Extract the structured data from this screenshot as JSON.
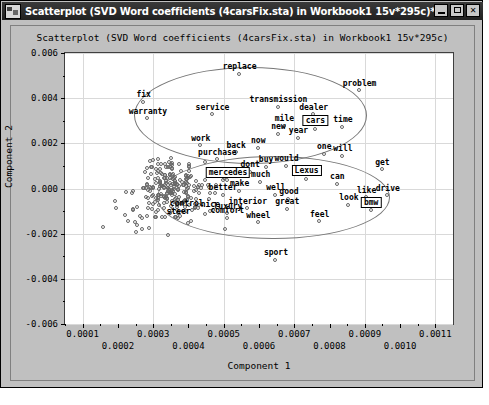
{
  "window": {
    "title": "Scatterplot (SVD Word coefficients (4carsFix.sta) in Workbook1 15v*295c)*",
    "icon": "app-icon",
    "minimize_label": "_",
    "maximize_label": "□",
    "close_label": "✕"
  },
  "chart_data": {
    "type": "scatter",
    "title": "Scatterplot (SVD Word coefficients (4carsFix.sta) in Workbook1 15v*295c)",
    "xlabel": "Component 1",
    "ylabel": "Component 2",
    "xlim": [
      5e-05,
      0.00115
    ],
    "ylim": [
      -0.006,
      0.006
    ],
    "grid": true,
    "legend": "none",
    "xticks": [
      "0.0001",
      "0.0002",
      "0.0003",
      "0.0004",
      "0.0005",
      "0.0006",
      "0.0007",
      "0.0008",
      "0.0009",
      "0.0010",
      "0.0011"
    ],
    "yticks": [
      "0.006",
      "0.004",
      "0.002",
      "0.000",
      "-0.002",
      "-0.004",
      "-0.006"
    ],
    "marker": "open-circle",
    "annotations": [
      {
        "label": "replace",
        "x": 0.000545,
        "y": 0.00507
      },
      {
        "label": "problem",
        "x": 0.000885,
        "y": 0.00432
      },
      {
        "label": "fix",
        "x": 0.000273,
        "y": 0.00382
      },
      {
        "label": "transmission",
        "x": 0.000655,
        "y": 0.0036
      },
      {
        "label": "service",
        "x": 0.000468,
        "y": 0.00327
      },
      {
        "label": "dealer",
        "x": 0.000755,
        "y": 0.00327
      },
      {
        "label": "warranty",
        "x": 0.000285,
        "y": 0.00308
      },
      {
        "label": "mile",
        "x": 0.000672,
        "y": 0.00275
      },
      {
        "label": "time",
        "x": 0.000838,
        "y": 0.00272
      },
      {
        "label": "cars",
        "x": 0.00076,
        "y": 0.00262,
        "boxed": true
      },
      {
        "label": "new",
        "x": 0.000655,
        "y": 0.0024
      },
      {
        "label": "year",
        "x": 0.000712,
        "y": 0.00222
      },
      {
        "label": "work",
        "x": 0.000435,
        "y": 0.0019
      },
      {
        "label": "now",
        "x": 0.000598,
        "y": 0.00178
      },
      {
        "label": "back",
        "x": 0.000535,
        "y": 0.00158
      },
      {
        "label": "one",
        "x": 0.000785,
        "y": 0.00152
      },
      {
        "label": "will",
        "x": 0.000838,
        "y": 0.00142
      },
      {
        "label": "purchase",
        "x": 0.000482,
        "y": 0.00128
      },
      {
        "label": "buy",
        "x": 0.00062,
        "y": 0.00095
      },
      {
        "label": "would",
        "x": 0.000678,
        "y": 0.00098
      },
      {
        "label": "dont",
        "x": 0.000575,
        "y": 0.00072
      },
      {
        "label": "get",
        "x": 0.00095,
        "y": 0.00082
      },
      {
        "label": "Lexus",
        "x": 0.000735,
        "y": 0.00042,
        "boxed": true
      },
      {
        "label": "mercedes",
        "x": 0.000512,
        "y": 0.00035,
        "boxed": true
      },
      {
        "label": "much",
        "x": 0.000605,
        "y": 0.00028
      },
      {
        "label": "can",
        "x": 0.000822,
        "y": 0.00018
      },
      {
        "label": "make",
        "x": 0.000545,
        "y": -0.00012
      },
      {
        "label": "better",
        "x": 0.000498,
        "y": -0.0003
      },
      {
        "label": "well",
        "x": 0.000648,
        "y": -0.0003
      },
      {
        "label": "good",
        "x": 0.000685,
        "y": -0.00048
      },
      {
        "label": "like",
        "x": 0.000905,
        "y": -0.00042
      },
      {
        "label": "drive",
        "x": 0.000965,
        "y": -0.00032
      },
      {
        "label": "interior",
        "x": 0.000568,
        "y": -0.0009
      },
      {
        "label": "great",
        "x": 0.00068,
        "y": -0.00092
      },
      {
        "label": "look",
        "x": 0.000855,
        "y": -0.00075
      },
      {
        "label": "bmw",
        "x": 0.000918,
        "y": -0.00098,
        "boxed": true
      },
      {
        "label": "control",
        "x": 0.000395,
        "y": -0.001
      },
      {
        "label": "nice",
        "x": 0.000462,
        "y": -0.00102
      },
      {
        "label": "luxury",
        "x": 0.000512,
        "y": -0.00112
      },
      {
        "label": "comfort",
        "x": 0.00051,
        "y": -0.00132
      },
      {
        "label": "steer",
        "x": 0.000372,
        "y": -0.00135
      },
      {
        "label": "wheel",
        "x": 0.000598,
        "y": -0.00152
      },
      {
        "label": "feel",
        "x": 0.000772,
        "y": -0.00148
      },
      {
        "label": "sport",
        "x": 0.000648,
        "y": -0.00318
      }
    ],
    "ellipses": [
      {
        "cx": 0.000575,
        "cy": 0.00322,
        "rx": 0.00033,
        "ry": 0.00215
      },
      {
        "cx": 0.00064,
        "cy": -0.0004,
        "rx": 0.00033,
        "ry": 0.00185
      }
    ],
    "cloud_note": "dense cluster of open-circle markers centered near x=0.00035, y=0.0000"
  }
}
